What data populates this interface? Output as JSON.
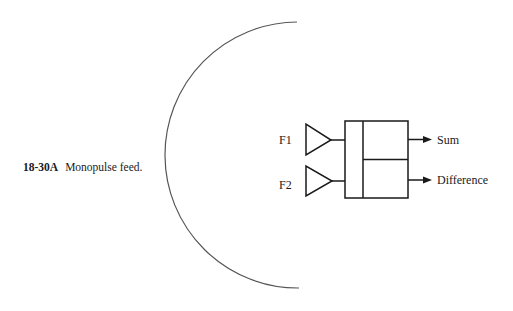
{
  "figure": {
    "number": "18-30A",
    "caption": "Monopulse feed."
  },
  "diagram": {
    "reflector": {
      "label": ""
    },
    "feeds": [
      {
        "label": "F1"
      },
      {
        "label": "F2"
      }
    ],
    "outputs": [
      {
        "label": "Sum"
      },
      {
        "label": "Difference"
      }
    ],
    "colors": {
      "stroke": "#1a1a1a",
      "reflector": "#555555"
    }
  }
}
